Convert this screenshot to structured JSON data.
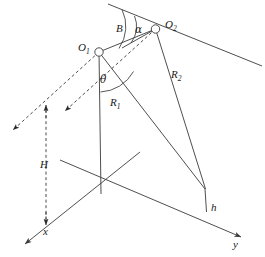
{
  "figure": {
    "background_color": "#ffffff",
    "stroke_color": "#3a3a3a",
    "text_color": "#1a1a1a",
    "line_width": 0.9
  },
  "labels": {
    "o1": {
      "base": "O",
      "sub": "1"
    },
    "o2": {
      "base": "O",
      "sub": "2"
    },
    "r1": {
      "base": "R",
      "sub": "1"
    },
    "r2": {
      "base": "R",
      "sub": "2"
    },
    "theta": "θ",
    "alpha": "α",
    "beta": "B",
    "height_H": "H",
    "height_h": "h",
    "axis_x": "x",
    "axis_y": "y"
  },
  "geometry": {
    "points": {
      "o1": {
        "x": 99,
        "y": 52,
        "marker": "open-circle",
        "radius": 4.2
      },
      "o2": {
        "x": 155.5,
        "y": 29,
        "marker": "open-circle",
        "radius": 4.2
      },
      "origin": {
        "x": 101,
        "y": 173
      },
      "nadir_foot": {
        "x": 101,
        "y": 194
      },
      "target_top": {
        "x": 205,
        "y": 189
      },
      "target_base": {
        "x": 206.5,
        "y": 212
      },
      "x_axis_end": {
        "x": 22,
        "y": 247
      },
      "y_axis_end": {
        "x": 244,
        "y": 238
      },
      "x_axis_back": {
        "x": 140,
        "y": 152
      },
      "y_axis_back": {
        "x": 60,
        "y": 160
      },
      "track_line_start": {
        "x": 108,
        "y": 4
      },
      "track_line_end": {
        "x": 262,
        "y": 66
      },
      "beta_ray_end": {
        "x": 124,
        "y": 47
      }
    },
    "solid_segments": [
      {
        "name": "o1-to-nadir",
        "x1": 99,
        "y1": 52,
        "x2": 101,
        "y2": 194
      },
      {
        "name": "o1-to-target-R1",
        "x1": 99,
        "y1": 52,
        "x2": 205,
        "y2": 189
      },
      {
        "name": "o2-to-target-R2",
        "x1": 155.5,
        "y1": 29,
        "x2": 205.5,
        "y2": 189
      },
      {
        "name": "o1-to-o2-baseline",
        "x1": 99,
        "y1": 52,
        "x2": 155.5,
        "y2": 29
      },
      {
        "name": "o2-to-beta-ray",
        "x1": 155.5,
        "y1": 29,
        "x2": 124,
        "y2": 47
      },
      {
        "name": "ground-track-line",
        "x1": 108,
        "y1": 4,
        "x2": 262,
        "y2": 66
      },
      {
        "name": "target-height-h",
        "x1": 205,
        "y1": 189,
        "x2": 206.5,
        "y2": 212
      },
      {
        "name": "x-axis",
        "x1": 140,
        "y1": 152,
        "x2": 22,
        "y2": 247
      },
      {
        "name": "y-axis",
        "x1": 60,
        "y1": 160,
        "x2": 244,
        "y2": 238
      }
    ],
    "dashed_segments": [
      {
        "name": "o1-velocity-dashed",
        "x1": 99,
        "y1": 52,
        "x2": 10,
        "y2": 132
      },
      {
        "name": "o2-velocity-dashed",
        "x1": 155.5,
        "y1": 29,
        "x2": 62,
        "y2": 113
      },
      {
        "name": "H-measure-dashed",
        "x1": 46,
        "y1": 104,
        "x2": 46,
        "y2": 226
      }
    ],
    "arc_angles": [
      {
        "name": "theta-arc",
        "center_x": 99,
        "center_y": 52,
        "radius": 40,
        "label": "theta"
      },
      {
        "name": "alpha-arc",
        "center_x": 155.5,
        "center_y": 29,
        "radius": 26,
        "label": "alpha"
      },
      {
        "name": "beta-arc",
        "center_x": 155.5,
        "center_y": 29,
        "radius": 38,
        "label": "beta"
      }
    ],
    "label_positions": {
      "o1": {
        "x": 78,
        "y": 50
      },
      "o2": {
        "x": 166,
        "y": 28
      },
      "r1": {
        "x": 110,
        "y": 104
      },
      "r2": {
        "x": 172,
        "y": 76
      },
      "theta": {
        "x": 100,
        "y": 82
      },
      "alpha": {
        "x": 136,
        "y": 32
      },
      "beta": {
        "x": 118,
        "y": 32
      },
      "height_H": {
        "x": 40,
        "y": 167
      },
      "height_h": {
        "x": 211,
        "y": 210
      },
      "axis_x": {
        "x": 44,
        "y": 234
      },
      "axis_y": {
        "x": 234,
        "y": 246
      }
    }
  }
}
